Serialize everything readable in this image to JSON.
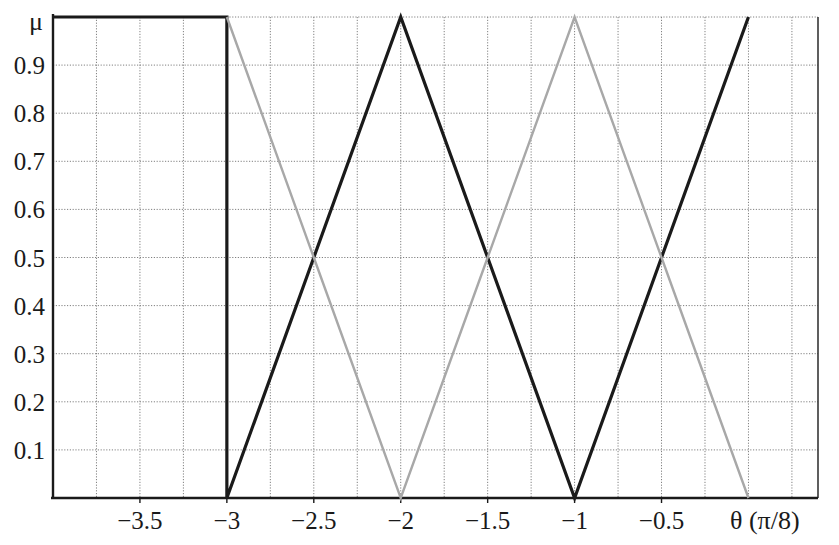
{
  "chart_data": {
    "type": "line",
    "title": "",
    "subtitle": "",
    "xlabel": "θ (π/8)",
    "ylabel": "μ",
    "xlim": [
      -4,
      0.4
    ],
    "ylim": [
      0,
      1
    ],
    "xticks": [
      -3.5,
      -3,
      -2.5,
      -2,
      -1.5,
      -1,
      -0.5
    ],
    "xtick_labels": [
      "−3.5",
      "−3",
      "−2.5",
      "−2",
      "−1.5",
      "−1",
      "−0.5"
    ],
    "yticks": [
      0.1,
      0.2,
      0.3,
      0.4,
      0.5,
      0.6,
      0.7,
      0.8,
      0.9
    ],
    "ytick_labels": [
      "0.1",
      "0.2",
      "0.3",
      "0.4",
      "0.5",
      "0.6",
      "0.7",
      "0.8",
      "0.9"
    ],
    "grid": true,
    "grid_style": "dotted",
    "grid_x_step": 0.25,
    "legend": "none",
    "colors": {
      "series_dark": "#1a1a1a",
      "series_gray": "#a8a8a8",
      "axis": "#1a1a1a",
      "grid": "#808080",
      "background": "#ffffff"
    },
    "series": [
      {
        "name": "dark-membership",
        "color": "#1a1a1a",
        "linewidth": 3.2,
        "points": [
          [
            -4.0,
            1.0
          ],
          [
            -3.0,
            1.0
          ],
          [
            -3.0,
            0.0
          ],
          [
            -2.5,
            0.5
          ],
          [
            -2.0,
            1.0
          ],
          [
            -1.5,
            0.5
          ],
          [
            -1.0,
            0.0
          ],
          [
            -0.5,
            0.5
          ],
          [
            0.0,
            1.0
          ]
        ]
      },
      {
        "name": "gray-membership",
        "color": "#a8a8a8",
        "linewidth": 2.4,
        "points": [
          [
            -3.0,
            1.0
          ],
          [
            -2.5,
            0.5
          ],
          [
            -2.0,
            0.0
          ],
          [
            -1.5,
            0.5
          ],
          [
            -1.0,
            1.0
          ],
          [
            -0.5,
            0.5
          ],
          [
            0.0,
            0.0
          ]
        ]
      }
    ],
    "crossings": [
      {
        "x": -2.5,
        "y": 0.5
      },
      {
        "x": -1.5,
        "y": 0.5
      },
      {
        "x": -0.5,
        "y": 0.5
      }
    ],
    "peaks_dark": [
      -4.0,
      -3.0,
      -2.0,
      0.0
    ],
    "peaks_gray": [
      -3.0,
      -1.0
    ],
    "zeros_dark": [
      -3.0,
      -1.0
    ],
    "zeros_gray": [
      -2.0,
      0.0
    ]
  },
  "geometry": {
    "plot_left": 53,
    "plot_right": 818,
    "plot_top": 17,
    "plot_bottom": 498
  }
}
